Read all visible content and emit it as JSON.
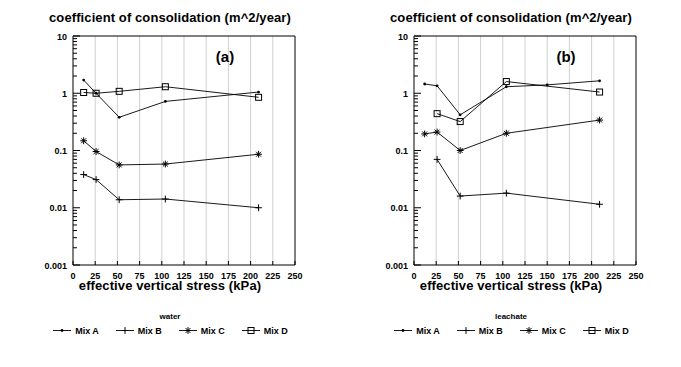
{
  "figure": {
    "panels": [
      {
        "id": "a",
        "letter": "(a)",
        "title": "coefficient of consolidation (m^2/year)",
        "xlabel": "effective vertical stress (kPa)",
        "legend_title": "water",
        "legend": [
          {
            "label": "Mix A",
            "marker": "dot"
          },
          {
            "label": "Mix B",
            "marker": "plus"
          },
          {
            "label": "Mix C",
            "marker": "asterisk"
          },
          {
            "label": "Mix D",
            "marker": "square"
          }
        ]
      },
      {
        "id": "b",
        "letter": "(b)",
        "title": "coefficient of consolidation (m^2/year)",
        "xlabel": "effective vertical stress (kPa)",
        "legend_title": "leachate",
        "legend": [
          {
            "label": "Mix A",
            "marker": "dot"
          },
          {
            "label": "Mix B",
            "marker": "plus"
          },
          {
            "label": "Mix C",
            "marker": "asterisk"
          },
          {
            "label": "Mix D",
            "marker": "square"
          }
        ]
      }
    ]
  },
  "chart_data": [
    {
      "type": "line",
      "panel": "a",
      "title": "coefficient of consolidation (m^2/year)",
      "subtitle": "(a)",
      "xlabel": "effective vertical stress (kPa)",
      "ylabel": "coefficient of consolidation (m^2/year)",
      "yscale": "log",
      "ylim": [
        0.001,
        10
      ],
      "xlim": [
        0,
        250
      ],
      "xticks": [
        0,
        25,
        50,
        75,
        100,
        125,
        150,
        175,
        200,
        225,
        250
      ],
      "xticklabels": [
        "0",
        "25",
        "50",
        "75",
        "100",
        "125",
        "150",
        "175",
        "200",
        "225",
        "250"
      ],
      "yticks": [
        0.001,
        0.01,
        0.1,
        1,
        10
      ],
      "yticklabels": [
        "0.001",
        "0.01",
        "0.1",
        "1",
        "10"
      ],
      "grid": "vertical",
      "legend_title": "water",
      "legend_position": "below",
      "series": [
        {
          "name": "Mix A",
          "marker": "dot",
          "x": [
            12,
            26,
            52,
            104,
            209
          ],
          "y": [
            1.7,
            1.0,
            0.38,
            0.72,
            1.05
          ]
        },
        {
          "name": "Mix B",
          "marker": "plus",
          "x": [
            12,
            26,
            52,
            104,
            209
          ],
          "y": [
            0.038,
            0.031,
            0.0138,
            0.0142,
            0.01
          ]
        },
        {
          "name": "Mix C",
          "marker": "asterisk",
          "x": [
            12,
            26,
            52,
            104,
            209
          ],
          "y": [
            0.148,
            0.096,
            0.056,
            0.058,
            0.086
          ]
        },
        {
          "name": "Mix D",
          "marker": "square",
          "x": [
            12,
            26,
            52,
            104,
            209
          ],
          "y": [
            1.03,
            1.0,
            1.08,
            1.3,
            0.85
          ]
        }
      ]
    },
    {
      "type": "line",
      "panel": "b",
      "title": "coefficient of consolidation (m^2/year)",
      "subtitle": "(b)",
      "xlabel": "effective vertical stress (kPa)",
      "ylabel": "coefficient of consolidation (m^2/year)",
      "yscale": "log",
      "ylim": [
        0.001,
        10
      ],
      "xlim": [
        0,
        250
      ],
      "xticks": [
        0,
        25,
        50,
        75,
        100,
        125,
        150,
        175,
        200,
        225,
        250
      ],
      "xticklabels": [
        "0",
        "25",
        "50",
        "75",
        "100",
        "125",
        "150",
        "175",
        "200",
        "225",
        "250"
      ],
      "yticks": [
        0.001,
        0.01,
        0.1,
        1,
        10
      ],
      "yticklabels": [
        "0.001",
        "0.01",
        "0.1",
        "1",
        "10"
      ],
      "grid": "vertical",
      "legend_title": "leachate",
      "legend_position": "below",
      "series": [
        {
          "name": "Mix A",
          "marker": "dot",
          "x": [
            12,
            26,
            52,
            104,
            150,
            209
          ],
          "y": [
            1.45,
            1.35,
            0.42,
            1.3,
            1.4,
            1.65
          ]
        },
        {
          "name": "Mix B",
          "marker": "plus",
          "x": [
            26,
            52,
            104,
            209
          ],
          "y": [
            0.07,
            0.016,
            0.018,
            0.0115
          ]
        },
        {
          "name": "Mix C",
          "marker": "asterisk",
          "x": [
            12,
            26,
            52,
            104,
            209
          ],
          "y": [
            0.195,
            0.21,
            0.1,
            0.2,
            0.34
          ]
        },
        {
          "name": "Mix D",
          "marker": "square",
          "x": [
            26,
            52,
            104,
            209
          ],
          "y": [
            0.44,
            0.32,
            1.6,
            1.05
          ]
        }
      ]
    }
  ]
}
